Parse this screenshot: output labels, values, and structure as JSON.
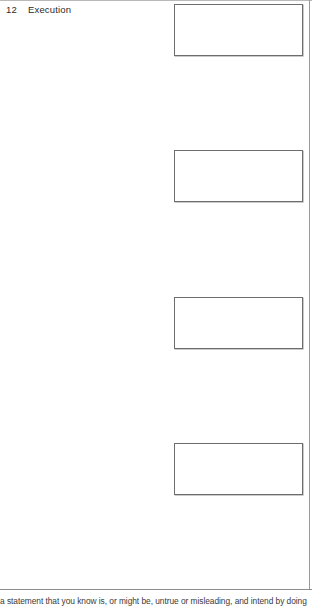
{
  "page": {
    "background_color": "#ffffff",
    "width": 312,
    "height": 607
  },
  "running_head": {
    "folio": "12",
    "chapter_title": "Execution"
  },
  "rules": {
    "top_rule_color": "#b9b9b9",
    "right_margin_rule_color": "#9a9a9a",
    "bottom_rule_color": "#8d8d8d"
  },
  "figure_boxes": {
    "border_color": "#6d6d6d",
    "fill_color": "#ffffff",
    "items": [
      {
        "label": ""
      },
      {
        "label": ""
      },
      {
        "label": ""
      },
      {
        "label": ""
      }
    ]
  },
  "body_text": {
    "clipped_line": "a statement that you know is, or might be, untrue or misleading, and intend by doing"
  }
}
